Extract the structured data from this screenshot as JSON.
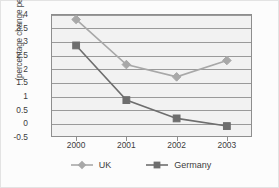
{
  "chart_data": {
    "type": "line",
    "title": "",
    "xlabel": "",
    "ylabel": "(percentage change per annum)",
    "categories": [
      "2000",
      "2001",
      "2002",
      "2003"
    ],
    "ylim": [
      -0.5,
      4
    ],
    "yticks": [
      "4",
      "3.5",
      "3",
      "2.5",
      "2",
      "1.5",
      "1",
      "0.5",
      "0",
      "-0.5"
    ],
    "ytick_values": [
      4,
      3.5,
      3,
      2.5,
      2,
      1.5,
      1,
      0.5,
      0,
      -0.5
    ],
    "grid": "horizontal",
    "legend_position": "bottom",
    "series": [
      {
        "name": "UK",
        "values": [
          3.8,
          2.15,
          1.7,
          2.3
        ],
        "color": "#a8a8a8",
        "marker": "diamond"
      },
      {
        "name": "Germany",
        "values": [
          2.85,
          0.85,
          0.18,
          -0.1
        ],
        "color": "#6e6e6e",
        "marker": "square"
      }
    ]
  },
  "legend": {
    "items": [
      {
        "label": "UK"
      },
      {
        "label": "Germany"
      }
    ]
  }
}
